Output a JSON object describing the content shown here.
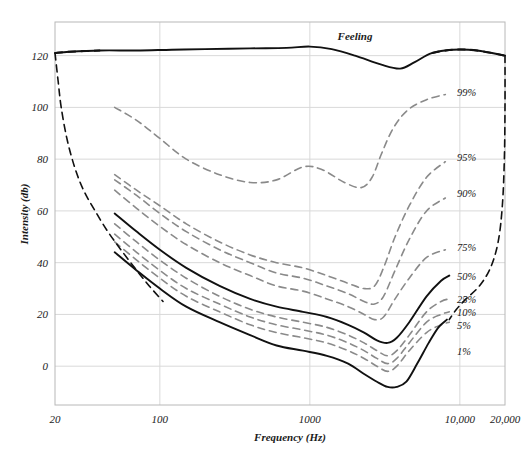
{
  "chart_data": {
    "type": "line",
    "title": "",
    "xlabel": "Frequency (Hz)",
    "ylabel": "Intensity (db)",
    "xscale": "log",
    "xlim": [
      20,
      20000
    ],
    "ylim": [
      -15,
      133
    ],
    "grid": true,
    "legend_position": "inline-right-of-curves",
    "xticks": [
      20,
      100,
      1000,
      10000,
      20000
    ],
    "xtick_labels": [
      "20",
      "100",
      "1000",
      "10,000",
      "20,000"
    ],
    "yticks": [
      0,
      20,
      40,
      60,
      80,
      100,
      120
    ],
    "ytick_labels": [
      "0",
      "20",
      "40",
      "60",
      "80",
      "100",
      "120"
    ],
    "annotations": [
      {
        "text": "Feeling",
        "x": 2000,
        "y": 126
      }
    ],
    "series": [
      {
        "name": "Feeling",
        "label": "Feeling",
        "style": "solid",
        "color": "#111111",
        "points": [
          [
            20,
            121
          ],
          [
            25,
            121.5
          ],
          [
            40,
            122
          ],
          [
            70,
            122
          ],
          [
            120,
            122.3
          ],
          [
            200,
            122.5
          ],
          [
            400,
            122.8
          ],
          [
            700,
            123
          ],
          [
            1000,
            123.5
          ],
          [
            1400,
            122.5
          ],
          [
            2000,
            120
          ],
          [
            3000,
            116.5
          ],
          [
            4000,
            115
          ],
          [
            5000,
            117.5
          ],
          [
            6500,
            121
          ],
          [
            9000,
            122.3
          ],
          [
            13000,
            122
          ],
          [
            20000,
            120
          ]
        ],
        "dashed_segments": [
          [
            20,
            40
          ],
          [
            6500,
            20000
          ]
        ]
      },
      {
        "name": "99%",
        "label": "99%",
        "style": "dashed",
        "color": "#8a8a8a",
        "label_at": [
          9000,
          106
        ],
        "points": [
          [
            50,
            100
          ],
          [
            70,
            95
          ],
          [
            100,
            88
          ],
          [
            150,
            80
          ],
          [
            250,
            74
          ],
          [
            400,
            71
          ],
          [
            600,
            72
          ],
          [
            900,
            77
          ],
          [
            1200,
            76
          ],
          [
            1700,
            71
          ],
          [
            2200,
            69
          ],
          [
            2600,
            73
          ],
          [
            3000,
            82
          ],
          [
            3600,
            92
          ],
          [
            4500,
            99
          ],
          [
            6000,
            103
          ],
          [
            8000,
            105
          ]
        ]
      },
      {
        "name": "95%",
        "label": "95%",
        "style": "dashed",
        "color": "#8a8a8a",
        "label_at": [
          9000,
          81
        ],
        "points": [
          [
            50,
            74
          ],
          [
            70,
            68
          ],
          [
            100,
            62
          ],
          [
            150,
            55
          ],
          [
            250,
            48
          ],
          [
            400,
            43
          ],
          [
            600,
            40
          ],
          [
            900,
            38
          ],
          [
            1300,
            35
          ],
          [
            1800,
            32
          ],
          [
            2300,
            30
          ],
          [
            2700,
            31
          ],
          [
            3100,
            38
          ],
          [
            3700,
            50
          ],
          [
            4600,
            62
          ],
          [
            6000,
            73
          ],
          [
            8000,
            79
          ]
        ]
      },
      {
        "name": "90%",
        "label": "90%",
        "style": "dashed",
        "color": "#8a8a8a",
        "label_at": [
          9000,
          67
        ],
        "points": [
          [
            50,
            72
          ],
          [
            70,
            66
          ],
          [
            100,
            59
          ],
          [
            150,
            52
          ],
          [
            250,
            45
          ],
          [
            400,
            40
          ],
          [
            600,
            36
          ],
          [
            900,
            34
          ],
          [
            1300,
            31
          ],
          [
            1800,
            28
          ],
          [
            2300,
            25
          ],
          [
            2700,
            24
          ],
          [
            3100,
            27
          ],
          [
            3700,
            37
          ],
          [
            4600,
            49
          ],
          [
            6000,
            60
          ],
          [
            8000,
            65
          ]
        ]
      },
      {
        "name": "75%",
        "label": "75%",
        "style": "dashed",
        "color": "#8a8a8a",
        "label_at": [
          9000,
          46
        ],
        "points": [
          [
            50,
            68
          ],
          [
            70,
            61
          ],
          [
            100,
            54
          ],
          [
            150,
            47
          ],
          [
            250,
            40
          ],
          [
            400,
            35
          ],
          [
            600,
            31
          ],
          [
            900,
            29
          ],
          [
            1300,
            26
          ],
          [
            1800,
            23
          ],
          [
            2300,
            20
          ],
          [
            2700,
            18
          ],
          [
            3100,
            19
          ],
          [
            3700,
            26
          ],
          [
            4600,
            34
          ],
          [
            6000,
            42
          ],
          [
            8000,
            45
          ]
        ]
      },
      {
        "name": "50%",
        "label": "50%",
        "style": "solid",
        "color": "#111111",
        "label_at": [
          9000,
          35
        ],
        "points": [
          [
            50,
            59
          ],
          [
            70,
            52
          ],
          [
            100,
            45
          ],
          [
            150,
            38
          ],
          [
            250,
            31
          ],
          [
            400,
            26
          ],
          [
            600,
            23
          ],
          [
            900,
            21
          ],
          [
            1300,
            19
          ],
          [
            1800,
            16
          ],
          [
            2300,
            13
          ],
          [
            2800,
            10
          ],
          [
            3300,
            9
          ],
          [
            3800,
            11
          ],
          [
            4600,
            17
          ],
          [
            6000,
            27
          ],
          [
            7500,
            33
          ],
          [
            8500,
            35
          ]
        ]
      },
      {
        "name": "25%",
        "label": "25%",
        "style": "dashed",
        "color": "#8a8a8a",
        "label_at": [
          9000,
          26
        ],
        "points": [
          [
            50,
            55
          ],
          [
            70,
            48
          ],
          [
            100,
            41
          ],
          [
            150,
            34
          ],
          [
            250,
            27
          ],
          [
            400,
            22
          ],
          [
            600,
            19
          ],
          [
            900,
            17
          ],
          [
            1300,
            15
          ],
          [
            1800,
            12
          ],
          [
            2300,
            9
          ],
          [
            2800,
            6
          ],
          [
            3300,
            4
          ],
          [
            3800,
            6
          ],
          [
            4600,
            12
          ],
          [
            6000,
            21
          ],
          [
            7500,
            25
          ],
          [
            8500,
            26
          ]
        ]
      },
      {
        "name": "10%",
        "label": "10%",
        "style": "dashed",
        "color": "#8a8a8a",
        "label_at": [
          9000,
          21
        ],
        "points": [
          [
            50,
            51
          ],
          [
            70,
            44
          ],
          [
            100,
            37
          ],
          [
            150,
            30
          ],
          [
            250,
            24
          ],
          [
            400,
            19
          ],
          [
            600,
            16
          ],
          [
            900,
            14
          ],
          [
            1300,
            12
          ],
          [
            1800,
            9
          ],
          [
            2300,
            6
          ],
          [
            2800,
            3
          ],
          [
            3300,
            1
          ],
          [
            3800,
            3
          ],
          [
            4600,
            9
          ],
          [
            6000,
            17
          ],
          [
            7500,
            20
          ],
          [
            8500,
            21
          ]
        ]
      },
      {
        "name": "5%",
        "label": "5%",
        "style": "dashed",
        "color": "#8a8a8a",
        "label_at": [
          9000,
          16
        ],
        "points": [
          [
            50,
            48
          ],
          [
            70,
            41
          ],
          [
            100,
            34
          ],
          [
            150,
            27
          ],
          [
            250,
            21
          ],
          [
            400,
            16
          ],
          [
            600,
            13
          ],
          [
            900,
            11
          ],
          [
            1300,
            9
          ],
          [
            1800,
            6
          ],
          [
            2300,
            3
          ],
          [
            2800,
            0
          ],
          [
            3300,
            -2
          ],
          [
            3800,
            0
          ],
          [
            4600,
            6
          ],
          [
            6000,
            13
          ],
          [
            7500,
            16
          ],
          [
            8500,
            17
          ]
        ]
      },
      {
        "name": "1%",
        "label": "1%",
        "style": "solid",
        "color": "#111111",
        "label_at": [
          9000,
          6
        ],
        "points": [
          [
            50,
            44
          ],
          [
            70,
            37
          ],
          [
            100,
            30
          ],
          [
            150,
            23
          ],
          [
            250,
            17
          ],
          [
            400,
            12
          ],
          [
            600,
            8
          ],
          [
            900,
            6
          ],
          [
            1300,
            4
          ],
          [
            1800,
            1
          ],
          [
            2300,
            -3
          ],
          [
            2800,
            -6
          ],
          [
            3300,
            -8
          ],
          [
            3800,
            -8
          ],
          [
            4400,
            -6
          ],
          [
            5200,
            1
          ],
          [
            6200,
            9
          ],
          [
            7200,
            15
          ],
          [
            8200,
            18
          ]
        ]
      },
      {
        "name": "left-boundary",
        "label": "",
        "style": "dashed",
        "color": "#111111",
        "points": [
          [
            20,
            121
          ],
          [
            21,
            110
          ],
          [
            22,
            100
          ],
          [
            24,
            88
          ],
          [
            27,
            77
          ],
          [
            31,
            68
          ],
          [
            37,
            60
          ],
          [
            45,
            52
          ],
          [
            55,
            45
          ],
          [
            68,
            38
          ],
          [
            85,
            31
          ],
          [
            105,
            25
          ]
        ]
      },
      {
        "name": "right-boundary",
        "label": "",
        "style": "dashed",
        "color": "#111111",
        "points": [
          [
            20000,
            120
          ],
          [
            20000,
            100
          ],
          [
            19800,
            80
          ],
          [
            19200,
            62
          ],
          [
            18000,
            48
          ],
          [
            16000,
            38
          ],
          [
            13500,
            31
          ],
          [
            11000,
            26
          ],
          [
            9500,
            22
          ],
          [
            8500,
            18
          ]
        ]
      }
    ]
  },
  "axes": {
    "y_title": "Intensity (db)",
    "x_title": "Frequency (Hz)"
  }
}
